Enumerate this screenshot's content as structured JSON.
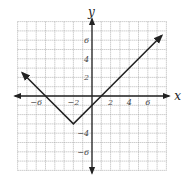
{
  "chart_data": {
    "type": "line",
    "title": "",
    "xlabel": "x",
    "ylabel": "y",
    "xlim": [
      -8,
      8
    ],
    "ylim": [
      -8,
      8
    ],
    "grid": true,
    "x_ticks": [
      -6,
      -2,
      2,
      4,
      6
    ],
    "y_ticks": [
      6,
      4,
      2,
      -4,
      -6
    ],
    "x_tick_labels": [
      "−6",
      "−2",
      "2",
      "4",
      "6"
    ],
    "y_tick_labels": [
      "6",
      "4",
      "2",
      "−4",
      "−6"
    ],
    "function": "y = |x + 2| − 3",
    "series": [
      {
        "name": "y = |x+2| − 3",
        "x": [
          -7.5,
          -5,
          -2,
          1,
          7.5
        ],
        "y": [
          2.5,
          0,
          -3,
          0,
          6.5
        ],
        "vertex": [
          -2,
          -3
        ],
        "arrows_at_ends": true
      }
    ],
    "colors": {
      "line": "#222222",
      "grid": "#9a9a9a",
      "axes": "#222222"
    }
  },
  "labels": {
    "x": "x",
    "y": "y"
  }
}
